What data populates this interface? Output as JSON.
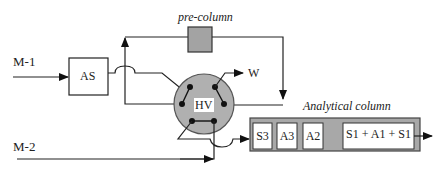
{
  "diagram": {
    "inputs": [
      {
        "id": "m1",
        "label": "M-1"
      },
      {
        "id": "m2",
        "label": "M-2"
      }
    ],
    "autosampler": {
      "label": "AS"
    },
    "valve": {
      "label": "HV",
      "fill": "#b0b0b0"
    },
    "waste": {
      "label": "W"
    },
    "precolumn": {
      "label": "pre-column",
      "fill": "#a3a3a3"
    },
    "analytical_column": {
      "label": "Analytical column",
      "fill": "#a8a8a8",
      "segments": [
        {
          "label": "S3"
        },
        {
          "label": "A3"
        },
        {
          "label": "A2"
        },
        {
          "label": "S1 + A1 + S1"
        }
      ]
    }
  }
}
